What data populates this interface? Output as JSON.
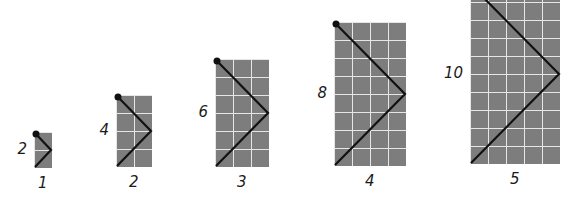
{
  "figures": [
    {
      "index": 1,
      "height_label": "2",
      "width_label": "1",
      "cols": 1,
      "rows": 2,
      "x": 34,
      "y": 132
    },
    {
      "index": 2,
      "height_label": "4",
      "width_label": "2",
      "cols": 2,
      "rows": 4,
      "x": 116,
      "y": 95
    },
    {
      "index": 3,
      "height_label": "6",
      "width_label": "3",
      "cols": 3,
      "rows": 6,
      "x": 215,
      "y": 59
    },
    {
      "index": 4,
      "height_label": "8",
      "width_label": "4",
      "cols": 4,
      "rows": 8,
      "x": 334,
      "y": 22
    },
    {
      "index": 5,
      "height_label": "10",
      "width_label": "5",
      "cols": 5,
      "rows": 10,
      "x": 470,
      "y": -16
    }
  ],
  "style": {
    "cell_size": 18,
    "grid_fill": "#7d7d7d",
    "grid_line": "#e6e6e6",
    "path_color": "#111111"
  }
}
